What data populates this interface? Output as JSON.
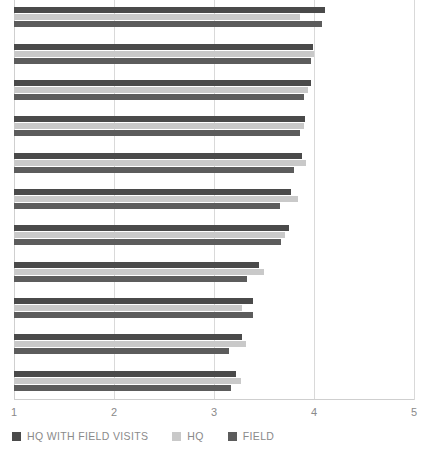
{
  "chart_data": {
    "type": "bar",
    "orientation": "horizontal",
    "title": "",
    "subtitle": "",
    "xlabel": "",
    "ylabel": "",
    "xlim": [
      1,
      5
    ],
    "xticks": [
      1,
      2,
      3,
      4,
      5
    ],
    "xtick_labels": [
      "1",
      "2",
      "3",
      "4",
      "5"
    ],
    "grid": true,
    "grid_axis": "x",
    "legend_position": "bottom-left",
    "categories": [
      "group-1",
      "group-2",
      "group-3",
      "group-4",
      "group-5",
      "group-6",
      "group-7",
      "group-8",
      "group-9",
      "group-10",
      "group-11"
    ],
    "ytick_labels": [
      "",
      "",
      "",
      "",
      "",
      "",
      "",
      "",
      "",
      "",
      ""
    ],
    "series": [
      {
        "name": "HQ WITH FIELD VISITS",
        "color": "#4a4a4a",
        "values": [
          4.11,
          3.99,
          3.97,
          3.91,
          3.88,
          3.77,
          3.75,
          3.45,
          3.39,
          3.28,
          3.22
        ]
      },
      {
        "name": "HQ",
        "color": "#c9c9c9",
        "values": [
          3.86,
          4.0,
          3.94,
          3.9,
          3.92,
          3.84,
          3.71,
          3.5,
          3.28,
          3.32,
          3.27
        ]
      },
      {
        "name": "FIELD",
        "color": "#5c5c5c",
        "values": [
          4.08,
          3.97,
          3.9,
          3.86,
          3.8,
          3.66,
          3.67,
          3.33,
          3.39,
          3.15,
          3.17
        ]
      }
    ]
  },
  "axis": {
    "tick_color": "#8a8a8a",
    "grid_color": "#d9d9d9"
  },
  "legend": {
    "items": [
      {
        "label": "HQ WITH FIELD VISITS",
        "color": "#4a4a4a"
      },
      {
        "label": "HQ",
        "color": "#c9c9c9"
      },
      {
        "label": "FIELD",
        "color": "#5c5c5c"
      }
    ]
  }
}
